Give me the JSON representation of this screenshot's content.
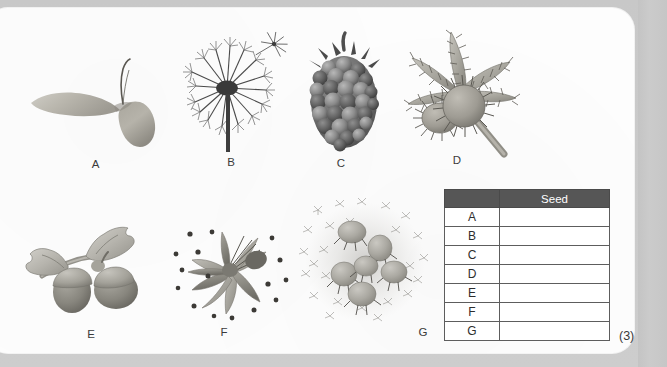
{
  "worksheet": {
    "marks": "(3)"
  },
  "specimens": [
    {
      "id": "A",
      "label": "A",
      "name": "winged-maple-seed"
    },
    {
      "id": "B",
      "label": "B",
      "name": "dandelion-seed-head"
    },
    {
      "id": "C",
      "label": "C",
      "name": "blackberry-fruit"
    },
    {
      "id": "D",
      "label": "D",
      "name": "burr-fruit-with-leaves"
    },
    {
      "id": "E",
      "label": "E",
      "name": "acorns-with-oak-leaves"
    },
    {
      "id": "F",
      "label": "F",
      "name": "exploding-seed-pod"
    },
    {
      "id": "G",
      "label": "G",
      "name": "burr-seed-cluster"
    }
  ],
  "table": {
    "headers": [
      "",
      "Seed"
    ],
    "rows": [
      {
        "letter": "A",
        "seed": ""
      },
      {
        "letter": "B",
        "seed": ""
      },
      {
        "letter": "C",
        "seed": ""
      },
      {
        "letter": "D",
        "seed": ""
      },
      {
        "letter": "E",
        "seed": ""
      },
      {
        "letter": "F",
        "seed": ""
      },
      {
        "letter": "G",
        "seed": ""
      }
    ]
  },
  "colors": {
    "page_background": "#c9c9c9",
    "paper": "#fdfdfd",
    "table_header": "#565656",
    "table_border": "#5d5d5d",
    "label_text": "#3b3b3b"
  }
}
